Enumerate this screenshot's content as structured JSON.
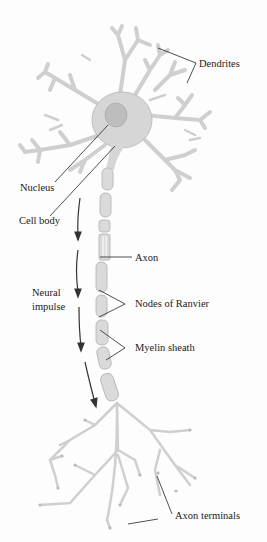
{
  "diagram": {
    "labels": {
      "dendrites": "Dendrites",
      "nucleus": "Nucleus",
      "cell_body": "Cell body",
      "axon": "Axon",
      "neural_impulse_line1": "Neural",
      "neural_impulse_line2": "impulse",
      "nodes_of_ranvier": "Nodes of Ranvier",
      "myelin_sheath": "Myelin sheath",
      "axon_terminals": "Axon terminals"
    },
    "colors": {
      "neuron_fill": "#d6d6d6",
      "neuron_stroke": "#b5b5b5",
      "nucleus_fill": "#bdbdbd",
      "leader_line": "#222222",
      "arrow": "#333333",
      "background": "#fdfdfd"
    }
  }
}
